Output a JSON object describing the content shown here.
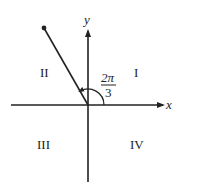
{
  "diagram": {
    "axes": {
      "x_label": "x",
      "y_label": "y"
    },
    "quadrants": {
      "q1": "I",
      "q2": "II",
      "q3": "III",
      "q4": "IV"
    },
    "angle": {
      "numerator": "2π",
      "denominator": "3",
      "degrees": 120
    },
    "colors": {
      "stroke": "#222222",
      "background": "#ffffff"
    }
  }
}
